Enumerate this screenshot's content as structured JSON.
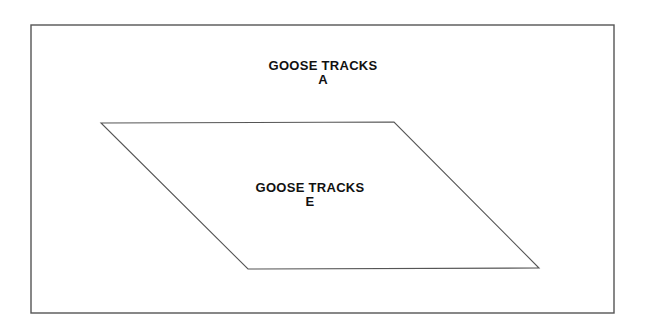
{
  "diagram": {
    "outer_region": {
      "label_line1": "GOOSE TRACKS",
      "label_line2": "A"
    },
    "inner_region": {
      "shape": "parallelogram",
      "label_line1": "GOOSE TRACKS",
      "label_line2": "E"
    },
    "colors": {
      "line": "#555555",
      "text": "#111111",
      "background": "#ffffff"
    }
  }
}
